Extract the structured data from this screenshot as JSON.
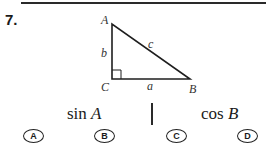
{
  "question": {
    "number": "7.",
    "figure": {
      "type": "right-triangle",
      "vertices": {
        "A": "A",
        "B": "B",
        "C": "C"
      },
      "sides": {
        "a": "a",
        "b": "b",
        "c": "c"
      },
      "right_angle_at": "C"
    },
    "left_expression": {
      "func": "sin",
      "var": "A"
    },
    "right_expression": {
      "func": "cos",
      "var": "B"
    },
    "choices": [
      {
        "label": "A"
      },
      {
        "label": "B"
      },
      {
        "label": "C"
      },
      {
        "label": "D"
      }
    ]
  }
}
